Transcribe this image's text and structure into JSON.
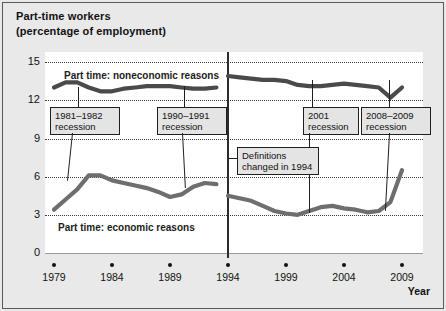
{
  "chart_data": {
    "type": "line",
    "title": "Part-time workers\n(percentage of employment)",
    "xlabel": "Year",
    "ylabel": "",
    "xlim": [
      1979,
      2010
    ],
    "ylim": [
      0,
      15
    ],
    "yticks": [
      0,
      3,
      6,
      9,
      12,
      15
    ],
    "ytick_labels": [
      "0",
      "3",
      "6",
      "9",
      "12",
      "15"
    ],
    "xticks": [
      1979,
      1984,
      1989,
      1994,
      1999,
      2004,
      2009
    ],
    "xtick_labels": [
      "1979",
      "1984",
      "1989",
      "1994",
      "1999",
      "2004",
      "2009"
    ],
    "grid": "horizontal-dotted",
    "legend": "inline-labels",
    "series": [
      {
        "name": "Part time: noneconomic reasons",
        "color": "#4a4a4a",
        "x": [
          1979,
          1980,
          1981,
          1982,
          1983,
          1984,
          1985,
          1986,
          1987,
          1988,
          1989,
          1990,
          1991,
          1992,
          1993,
          1994,
          1995,
          1996,
          1997,
          1998,
          1999,
          2000,
          2001,
          2002,
          2003,
          2004,
          2005,
          2006,
          2007,
          2008,
          2009
        ],
        "values": [
          13.0,
          13.4,
          13.4,
          13.0,
          12.7,
          12.7,
          12.9,
          13.0,
          13.1,
          13.1,
          13.1,
          13.0,
          12.9,
          12.9,
          13.0,
          13.9,
          13.8,
          13.7,
          13.6,
          13.6,
          13.5,
          13.2,
          13.1,
          13.1,
          13.2,
          13.3,
          13.2,
          13.1,
          13.0,
          12.2,
          13.0
        ]
      },
      {
        "name": "Part time: economic reasons",
        "color": "#6e6e6e",
        "x": [
          1979,
          1980,
          1981,
          1982,
          1983,
          1984,
          1985,
          1986,
          1987,
          1988,
          1989,
          1990,
          1991,
          1992,
          1993,
          1994,
          1995,
          1996,
          1997,
          1998,
          1999,
          2000,
          2001,
          2002,
          2003,
          2004,
          2005,
          2006,
          2007,
          2008,
          2009
        ],
        "values": [
          3.4,
          4.2,
          5.0,
          6.1,
          6.1,
          5.7,
          5.5,
          5.3,
          5.1,
          4.8,
          4.4,
          4.6,
          5.2,
          5.5,
          5.4,
          4.5,
          4.3,
          4.1,
          3.7,
          3.3,
          3.1,
          3.0,
          3.3,
          3.6,
          3.7,
          3.5,
          3.4,
          3.2,
          3.3,
          4.0,
          6.5
        ]
      }
    ],
    "annotations": [
      {
        "label": "1981–1982\nrecession",
        "x_year": 1982,
        "style": "boxed"
      },
      {
        "label": "1990–1991\nrecession",
        "x_year": 1991,
        "style": "boxed"
      },
      {
        "label": "2001\nrecession",
        "x_year": 2001,
        "style": "boxed"
      },
      {
        "label": "2008–2009\nrecession",
        "x_year": 2009,
        "style": "boxed"
      },
      {
        "label": "Definitions\nchanged in 1994",
        "x_year": 1994,
        "style": "boxed"
      }
    ]
  },
  "labels": {
    "title": "Part-time workers\n(percentage of employment)",
    "x_axis_title": "Year",
    "series_noneconomic": "Part time: noneconomic reasons",
    "series_economic": "Part time: economic reasons",
    "y_0": "0",
    "y_3": "3",
    "y_6": "6",
    "y_9": "9",
    "y_12": "12",
    "y_15": "15",
    "x_1979": "1979",
    "x_1984": "1984",
    "x_1989": "1989",
    "x_1994": "1994",
    "x_1999": "1999",
    "x_2004": "2004",
    "x_2009": "2009",
    "callout_1981": "1981–1982\nrecession",
    "callout_1990": "1990–1991\nrecession",
    "callout_2001": "2001\nrecession",
    "callout_2008": "2008–2009\nrecession",
    "callout_definitions": "Definitions\nchanged in 1994"
  },
  "colors": {
    "figure_background": "#e9e9e9",
    "plot_background": "#ffffff",
    "frame": "#5a5a5a",
    "gridline": "#3a3a3a",
    "series_noneconomic": "#4a4a4a",
    "series_economic": "#6e6e6e",
    "callout_background": "#e4e4e4",
    "text": "#111111"
  }
}
